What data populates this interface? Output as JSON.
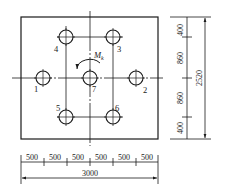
{
  "diagram": {
    "type": "bolt-pattern-plan",
    "plate": {
      "left": 21,
      "top": 17,
      "right": 158,
      "bottom": 139
    },
    "holes": [
      {
        "id": "1",
        "label": "1",
        "cx": 43,
        "cy": 78,
        "r": 7,
        "label_x": 34,
        "label_y": 92
      },
      {
        "id": "2",
        "label": "2",
        "cx": 136,
        "cy": 78,
        "r": 7,
        "label_x": 143,
        "label_y": 93
      },
      {
        "id": "3",
        "label": "3",
        "cx": 113,
        "cy": 37,
        "r": 7,
        "label_x": 117,
        "label_y": 52
      },
      {
        "id": "4",
        "label": "4",
        "cx": 66,
        "cy": 37,
        "r": 7,
        "label_x": 54,
        "label_y": 52
      },
      {
        "id": "5",
        "label": "5",
        "cx": 66,
        "cy": 117,
        "r": 7,
        "label_x": 56,
        "label_y": 111
      },
      {
        "id": "6",
        "label": "6",
        "cx": 113,
        "cy": 117,
        "r": 7,
        "label_x": 115,
        "label_y": 111
      },
      {
        "id": "7",
        "label": "7",
        "cx": 90,
        "cy": 78,
        "r": 7,
        "label_x": 92,
        "label_y": 92
      }
    ],
    "moment": {
      "symbol": "M",
      "subscript": "k",
      "direction": "counterclockwise"
    },
    "vertical_dimensions": {
      "segments": [
        "400",
        "860",
        "860",
        "400"
      ],
      "total": "2520"
    },
    "horizontal_dimensions": {
      "segments": [
        "500",
        "500",
        "500",
        "500",
        "500",
        "500"
      ],
      "total": "3000"
    },
    "line_color": "#1a1a1a"
  }
}
